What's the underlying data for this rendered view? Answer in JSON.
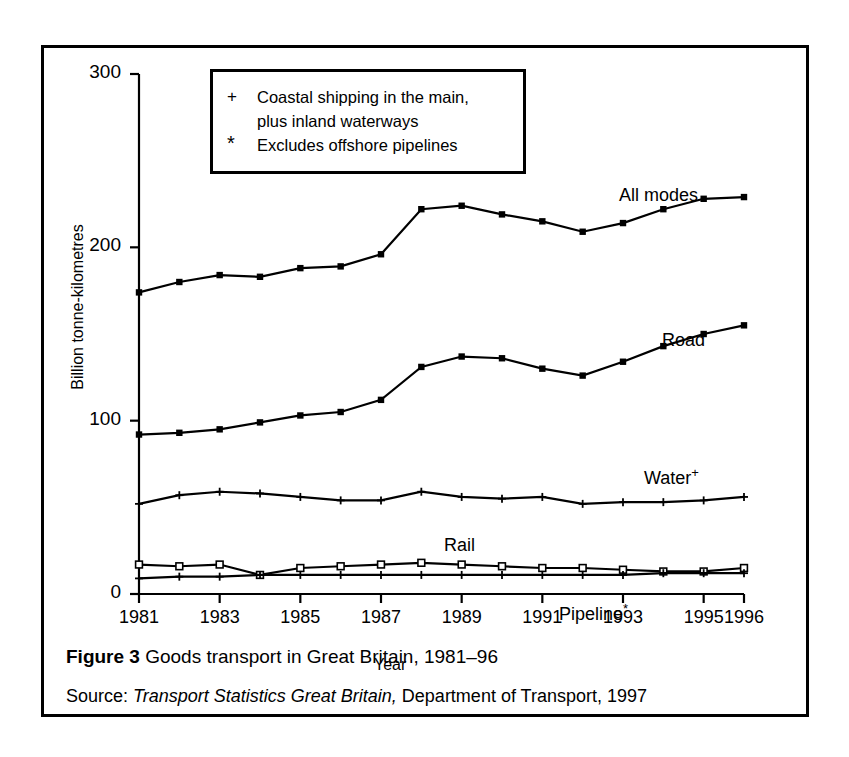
{
  "figure": {
    "caption_prefix": "Figure 3",
    "caption_text": "Goods transport in Great Britain, 1981–96",
    "source_prefix": "Source:",
    "source_italic": "Transport Statistics Great Britain,",
    "source_rest": "Department of Transport, 1997"
  },
  "legend_note": {
    "rows": [
      {
        "symbol": "+",
        "line1": "Coastal shipping in the main,",
        "line2": "plus inland waterways"
      },
      {
        "symbol": "*",
        "line1": "Excludes offshore pipelines",
        "line2": ""
      }
    ]
  },
  "chart_data": {
    "type": "line",
    "title": "Goods transport in Great Britain, 1981–96",
    "xlabel": "Year",
    "ylabel": "Billion tonne-kilometres",
    "xlim": [
      1981,
      1996
    ],
    "ylim": [
      0,
      300
    ],
    "yticks": [
      0,
      100,
      200,
      300
    ],
    "xticks": [
      1981,
      1983,
      1985,
      1987,
      1989,
      1991,
      1993,
      1995,
      1996
    ],
    "xtick_labels": [
      "1981",
      "1983",
      "1985",
      "1987",
      "1989",
      "1991",
      "1993",
      "1995",
      "1996"
    ],
    "grid": false,
    "legend_position": "inline-right-of-series",
    "x": [
      1981,
      1982,
      1983,
      1984,
      1985,
      1986,
      1987,
      1988,
      1989,
      1990,
      1991,
      1992,
      1993,
      1994,
      1995,
      1996
    ],
    "series": [
      {
        "name": "All modes",
        "marker": "filled-square",
        "label": "All modes",
        "values": [
          174,
          180,
          184,
          183,
          188,
          189,
          196,
          222,
          224,
          219,
          215,
          209,
          214,
          222,
          228,
          229
        ]
      },
      {
        "name": "Road",
        "marker": "filled-square",
        "label": "Road",
        "values": [
          92,
          93,
          95,
          99,
          103,
          105,
          112,
          131,
          137,
          136,
          130,
          126,
          134,
          143,
          150,
          155
        ]
      },
      {
        "name": "Water",
        "marker": "plus",
        "label": "Water",
        "label_superscript": "+",
        "values": [
          52,
          57,
          59,
          58,
          56,
          54,
          54,
          59,
          56,
          55,
          56,
          52,
          53,
          53,
          54,
          56
        ]
      },
      {
        "name": "Rail",
        "marker": "open-square",
        "label": "Rail",
        "values": [
          17,
          16,
          17,
          11,
          15,
          16,
          17,
          18,
          17,
          16,
          15,
          15,
          14,
          13,
          13,
          15
        ]
      },
      {
        "name": "Pipeline",
        "marker": "plus",
        "label": "Pipeline",
        "label_superscript": "*",
        "values": [
          9,
          10,
          10,
          11,
          11,
          11,
          11,
          11,
          11,
          11,
          11,
          11,
          11,
          12,
          12,
          12
        ]
      }
    ]
  }
}
